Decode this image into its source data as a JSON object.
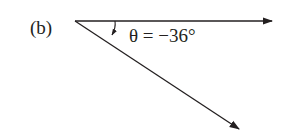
{
  "figure": {
    "panel_label": "(b)",
    "angle_label": "θ = −36°",
    "angle_degrees": -36,
    "colors": {
      "line": "#231f20",
      "background": "#ffffff"
    }
  }
}
